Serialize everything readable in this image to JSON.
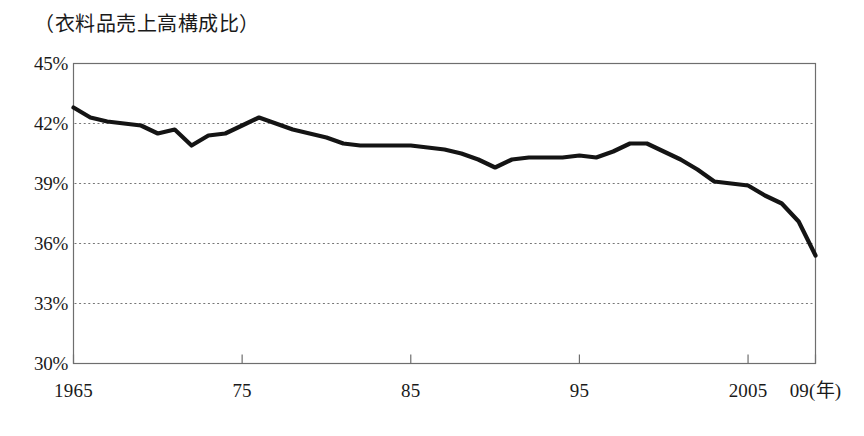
{
  "chart_data": {
    "type": "line",
    "title": "（衣料品売上高構成比）",
    "xlabel": "（年）",
    "ylabel": "",
    "unit": "%",
    "grid": "horizontal-dotted",
    "legend": "none",
    "xlim": [
      1965,
      2009
    ],
    "ylim": [
      30,
      45
    ],
    "y_ticks": [
      "45%",
      "39%",
      "42%",
      "36%",
      "33%",
      "30%"
    ],
    "y_tick_values": [
      45,
      42,
      39,
      36,
      33,
      30
    ],
    "x_ticks": [
      "1965",
      "75",
      "85",
      "95",
      "2005",
      "09(年)"
    ],
    "x_tick_values": [
      1965,
      1975,
      1985,
      1995,
      2005,
      2009
    ],
    "series": [
      {
        "name": "衣料品売上高構成比",
        "color": "#141414",
        "x": [
          1965,
          1966,
          1967,
          1968,
          1969,
          1970,
          1971,
          1972,
          1973,
          1974,
          1975,
          1976,
          1977,
          1978,
          1979,
          1980,
          1981,
          1982,
          1983,
          1984,
          1985,
          1986,
          1987,
          1988,
          1989,
          1990,
          1991,
          1992,
          1993,
          1994,
          1995,
          1996,
          1997,
          1998,
          1999,
          2000,
          2001,
          2002,
          2003,
          2004,
          2005,
          2006,
          2007,
          2008,
          2009
        ],
        "values": [
          42.8,
          42.3,
          42.1,
          42.0,
          41.9,
          41.5,
          41.7,
          40.9,
          41.4,
          41.5,
          41.9,
          42.3,
          42.0,
          41.7,
          41.5,
          41.3,
          41.0,
          40.9,
          40.9,
          40.9,
          40.9,
          40.8,
          40.7,
          40.5,
          40.2,
          39.8,
          40.2,
          40.3,
          40.3,
          40.3,
          40.4,
          40.3,
          40.6,
          41.0,
          41.0,
          40.6,
          40.2,
          39.7,
          39.1,
          39.0,
          38.9,
          38.4,
          38.0,
          37.1,
          35.4
        ]
      }
    ]
  },
  "axes": {
    "y_labels": [
      {
        "text": "45%",
        "value": 45
      },
      {
        "text": "42%",
        "value": 42
      },
      {
        "text": "39%",
        "value": 39
      },
      {
        "text": "36%",
        "value": 36
      },
      {
        "text": "33%",
        "value": 33
      },
      {
        "text": "30%",
        "value": 30
      }
    ],
    "x_labels": [
      {
        "text": "1965",
        "value": 1965
      },
      {
        "text": "75",
        "value": 1975
      },
      {
        "text": "85",
        "value": 1985
      },
      {
        "text": "95",
        "value": 1995
      },
      {
        "text": "2005",
        "value": 2005
      },
      {
        "text": "09(年)",
        "value": 2009
      }
    ]
  },
  "style": {
    "line_color": "#141414",
    "frame_color": "#6e6e6e",
    "grid_color": "#777777",
    "background": "#ffffff"
  }
}
